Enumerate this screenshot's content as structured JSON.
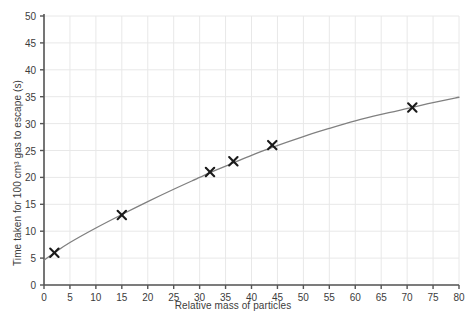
{
  "chart_data": {
    "type": "scatter",
    "title": "",
    "xlabel": "Relative mass of particles",
    "ylabel": "Time taken for 100 cm³ gas to escape (s)",
    "xlim": [
      0,
      80
    ],
    "ylim": [
      0,
      50
    ],
    "xticks": [
      0,
      5,
      10,
      15,
      20,
      25,
      30,
      35,
      40,
      45,
      50,
      55,
      60,
      65,
      70,
      75,
      80
    ],
    "yticks": [
      0,
      5,
      10,
      15,
      20,
      25,
      30,
      35,
      40,
      45,
      50
    ],
    "xtick_labels": [
      "0",
      "5",
      "10",
      "15",
      "20",
      "25",
      "30",
      "35",
      "40",
      "45",
      "50",
      "55",
      "60",
      "65",
      "70",
      "75",
      "80"
    ],
    "ytick_labels": [
      "0",
      "5",
      "10",
      "15",
      "20",
      "25",
      "30",
      "35",
      "40",
      "45",
      "50"
    ],
    "grid": true,
    "legend": false,
    "marker": "x",
    "marker_color": "#1a1a1a",
    "line_color": "#808080",
    "grid_color": "#e8e8e8",
    "axis_color": "#555555",
    "points": [
      {
        "x": 2,
        "y": 6
      },
      {
        "x": 15,
        "y": 13
      },
      {
        "x": 32,
        "y": 21
      },
      {
        "x": 36.5,
        "y": 23
      },
      {
        "x": 44,
        "y": 26
      },
      {
        "x": 71,
        "y": 33
      }
    ],
    "curve": [
      {
        "x": 0,
        "y": 4.6
      },
      {
        "x": 2,
        "y": 6.0
      },
      {
        "x": 5,
        "y": 7.9
      },
      {
        "x": 10,
        "y": 10.6
      },
      {
        "x": 15,
        "y": 13.1
      },
      {
        "x": 20,
        "y": 15.5
      },
      {
        "x": 25,
        "y": 17.8
      },
      {
        "x": 30,
        "y": 20.0
      },
      {
        "x": 32,
        "y": 20.9
      },
      {
        "x": 36.5,
        "y": 22.7
      },
      {
        "x": 40,
        "y": 24.1
      },
      {
        "x": 44,
        "y": 25.6
      },
      {
        "x": 50,
        "y": 27.6
      },
      {
        "x": 55,
        "y": 29.1
      },
      {
        "x": 60,
        "y": 30.5
      },
      {
        "x": 65,
        "y": 31.7
      },
      {
        "x": 71,
        "y": 33.0
      },
      {
        "x": 75,
        "y": 33.9
      },
      {
        "x": 80,
        "y": 34.9
      }
    ]
  },
  "top_clipped_text": ""
}
